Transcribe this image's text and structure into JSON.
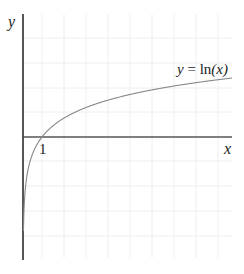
{
  "chart_data": {
    "type": "line",
    "title": "",
    "function": "y = ln(x)",
    "xlabel": "x",
    "ylabel": "y",
    "x_tick_labels": [
      "1"
    ],
    "annotations": [
      {
        "text": "y = ln(x)",
        "position": "upper right near curve"
      }
    ],
    "series": [
      {
        "name": "y = ln(x)",
        "x": [
          0.1,
          0.25,
          0.5,
          1,
          2,
          3,
          4,
          6,
          8,
          11
        ],
        "y": [
          -2.3,
          -1.39,
          -0.69,
          0,
          0.69,
          1.1,
          1.39,
          1.79,
          2.08,
          2.4
        ]
      }
    ],
    "grid": true,
    "xlim": [
      0,
      11
    ],
    "ylim": [
      -5,
      4.8
    ],
    "legend": "none"
  },
  "labels": {
    "y_axis": "y",
    "x_axis": "x",
    "tick_one": "1",
    "fn_y": "y",
    "fn_eq": " = ln",
    "fn_arg": "(x)"
  },
  "colors": {
    "axis": "#555555",
    "grid": "#eeeeee",
    "curve": "#888888",
    "text": "#222222"
  }
}
